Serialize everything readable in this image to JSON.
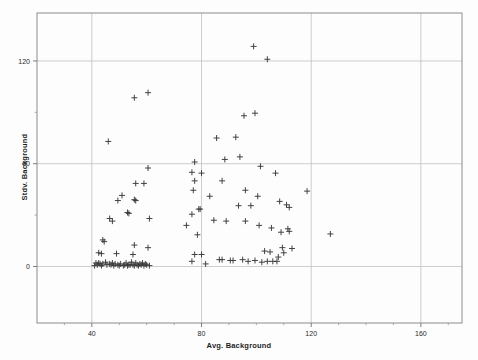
{
  "chart_data": {
    "type": "scatter",
    "title": "",
    "xlabel": "Avg. Background",
    "ylabel": "Stdv. Background",
    "xlim": [
      20,
      175
    ],
    "ylim": [
      -33,
      148
    ],
    "xticks": [
      40,
      80,
      120,
      160
    ],
    "yticks": [
      0,
      60,
      120
    ],
    "xtick_labels": [
      "40",
      "80",
      "120",
      "160"
    ],
    "ytick_labels": [
      "0",
      "60",
      "120"
    ],
    "x_minor_ticks": [
      30,
      50,
      60,
      70,
      90,
      100,
      110,
      130,
      140,
      150,
      170
    ],
    "y_minor_ticks": [
      30,
      90
    ],
    "grid": true,
    "grid_color": "#b9b9b9",
    "frame_color": "#8c8c8c",
    "marker": "plus",
    "marker_color": "#3a3a3a",
    "marker_size": 5,
    "series": [
      {
        "name": "Background statistics",
        "points": [
          [
            99.0,
            128.5
          ],
          [
            104.0,
            121.0
          ],
          [
            60.5,
            101.5
          ],
          [
            55.5,
            98.5
          ],
          [
            95.5,
            88.0
          ],
          [
            99.5,
            89.5
          ],
          [
            92.5,
            75.5
          ],
          [
            85.5,
            75.0
          ],
          [
            46.0,
            73.0
          ],
          [
            94.0,
            64.0
          ],
          [
            88.5,
            62.5
          ],
          [
            77.5,
            61.0
          ],
          [
            101.5,
            58.5
          ],
          [
            60.5,
            57.5
          ],
          [
            76.5,
            55.0
          ],
          [
            80.0,
            54.5
          ],
          [
            107.0,
            54.5
          ],
          [
            77.5,
            50.0
          ],
          [
            87.5,
            50.0
          ],
          [
            56.0,
            48.5
          ],
          [
            59.0,
            48.5
          ],
          [
            77.0,
            44.5
          ],
          [
            96.0,
            44.5
          ],
          [
            118.5,
            44.0
          ],
          [
            51.0,
            41.5
          ],
          [
            83.0,
            41.0
          ],
          [
            100.5,
            41.0
          ],
          [
            55.5,
            39.0
          ],
          [
            49.5,
            38.5
          ],
          [
            56.0,
            38.5
          ],
          [
            108.5,
            38.0
          ],
          [
            111.0,
            36.0
          ],
          [
            93.5,
            35.5
          ],
          [
            98.0,
            35.5
          ],
          [
            112.0,
            34.5
          ],
          [
            79.5,
            33.5
          ],
          [
            79.0,
            33.5
          ],
          [
            53.0,
            31.5
          ],
          [
            53.5,
            31.0
          ],
          [
            76.5,
            30.5
          ],
          [
            46.5,
            28.0
          ],
          [
            47.5,
            26.5
          ],
          [
            61.0,
            28.0
          ],
          [
            84.5,
            27.0
          ],
          [
            89.0,
            26.5
          ],
          [
            96.0,
            26.5
          ],
          [
            101.0,
            24.0
          ],
          [
            74.5,
            24.0
          ],
          [
            105.5,
            22.5
          ],
          [
            111.5,
            22.0
          ],
          [
            112.0,
            20.5
          ],
          [
            109.0,
            20.0
          ],
          [
            127.0,
            19.0
          ],
          [
            78.5,
            18.5
          ],
          [
            44.0,
            15.5
          ],
          [
            44.5,
            14.5
          ],
          [
            55.5,
            12.5
          ],
          [
            60.5,
            11.0
          ],
          [
            109.5,
            11.0
          ],
          [
            113.0,
            10.5
          ],
          [
            103.0,
            9.0
          ],
          [
            105.0,
            8.5
          ],
          [
            42.5,
            8.0
          ],
          [
            43.5,
            7.5
          ],
          [
            49.0,
            7.5
          ],
          [
            55.0,
            7.0
          ],
          [
            77.5,
            7.0
          ],
          [
            80.0,
            7.0
          ],
          [
            95.0,
            4.0
          ],
          [
            86.5,
            4.0
          ],
          [
            87.5,
            4.0
          ],
          [
            90.5,
            3.5
          ],
          [
            99.5,
            3.5
          ],
          [
            104.0,
            3.0
          ],
          [
            106.0,
            3.0
          ],
          [
            107.5,
            3.0
          ],
          [
            76.5,
            3.0
          ],
          [
            81.5,
            1.5
          ],
          [
            41.5,
            2.0
          ],
          [
            42.5,
            2.0
          ],
          [
            43.0,
            1.5
          ],
          [
            44.0,
            1.5
          ],
          [
            45.0,
            2.5
          ],
          [
            45.5,
            1.0
          ],
          [
            46.5,
            1.5
          ],
          [
            47.0,
            1.0
          ],
          [
            47.5,
            2.0
          ],
          [
            48.0,
            0.5
          ],
          [
            48.5,
            1.5
          ],
          [
            49.5,
            1.0
          ],
          [
            50.0,
            0.5
          ],
          [
            50.5,
            1.5
          ],
          [
            51.5,
            0.5
          ],
          [
            52.0,
            1.0
          ],
          [
            53.0,
            0.5
          ],
          [
            54.0,
            1.0
          ],
          [
            54.5,
            2.5
          ],
          [
            55.0,
            1.0
          ],
          [
            55.5,
            0.5
          ],
          [
            56.0,
            2.0
          ],
          [
            56.5,
            1.0
          ],
          [
            57.0,
            0.5
          ],
          [
            57.5,
            1.5
          ],
          [
            58.0,
            1.0
          ],
          [
            58.5,
            2.0
          ],
          [
            59.0,
            0.5
          ],
          [
            59.5,
            1.5
          ],
          [
            60.0,
            1.0
          ],
          [
            61.0,
            0.5
          ],
          [
            41.0,
            0.5
          ],
          [
            42.0,
            1.0
          ],
          [
            43.5,
            0.5
          ],
          [
            52.5,
            2.0
          ],
          [
            53.5,
            1.0
          ],
          [
            91.5,
            3.5
          ],
          [
            97.0,
            3.0
          ],
          [
            102.0,
            2.5
          ],
          [
            108.0,
            5.5
          ],
          [
            110.0,
            8.0
          ]
        ]
      }
    ]
  }
}
